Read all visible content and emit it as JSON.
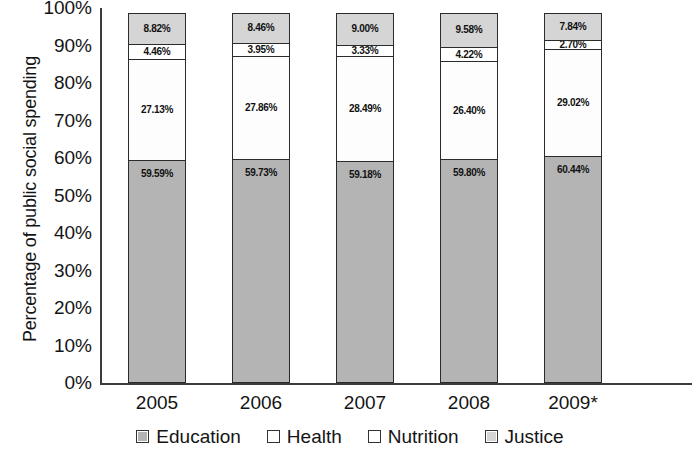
{
  "chart_data": {
    "type": "bar",
    "subtype": "stacked-100-percent",
    "title": "",
    "xlabel": "",
    "ylabel": "Percentage of public social spending",
    "ylim": [
      0,
      100
    ],
    "ytick_labels": [
      "100%",
      "90%",
      "80%",
      "70%",
      "60%",
      "50%",
      "40%",
      "30%",
      "20%",
      "10%",
      "0%"
    ],
    "ytick_values": [
      100,
      90,
      80,
      70,
      60,
      50,
      40,
      30,
      20,
      10,
      0
    ],
    "grid": false,
    "legend_position": "bottom",
    "categories": [
      "2005",
      "2006",
      "2007",
      "2008",
      "2009*"
    ],
    "series": [
      {
        "name": "Education",
        "color": "#b4b4b4",
        "values": [
          59.59,
          59.73,
          59.18,
          59.8,
          60.44
        ],
        "labels": [
          "59.59%",
          "59.73%",
          "59.18%",
          "59.80%",
          "60.44%"
        ]
      },
      {
        "name": "Health",
        "color": "#fdfdfd",
        "values": [
          27.13,
          27.86,
          28.49,
          26.4,
          29.02
        ],
        "labels": [
          "27.13%",
          "27.86%",
          "28.49%",
          "26.40%",
          "29.02%"
        ]
      },
      {
        "name": "Nutrition",
        "color": "#ffffff",
        "values": [
          4.46,
          3.95,
          3.33,
          4.22,
          2.7
        ],
        "labels": [
          "4.46%",
          "3.95%",
          "3.33%",
          "4.22%",
          "2.70%"
        ]
      },
      {
        "name": "Justice",
        "color": "#d5d5d5",
        "values": [
          8.82,
          8.46,
          9.0,
          9.58,
          7.84
        ],
        "labels": [
          "8.82%",
          "8.46%",
          "9.00%",
          "9.58%",
          "7.84%"
        ]
      }
    ]
  },
  "axis": {
    "y_title": "Percentage of public social spending"
  },
  "legend": {
    "items": [
      {
        "label": "Education",
        "color": "#b4b4b4"
      },
      {
        "label": "Health",
        "color": "#fdfdfd"
      },
      {
        "label": "Nutrition",
        "color": "#ffffff"
      },
      {
        "label": "Justice",
        "color": "#d5d5d5"
      }
    ]
  }
}
